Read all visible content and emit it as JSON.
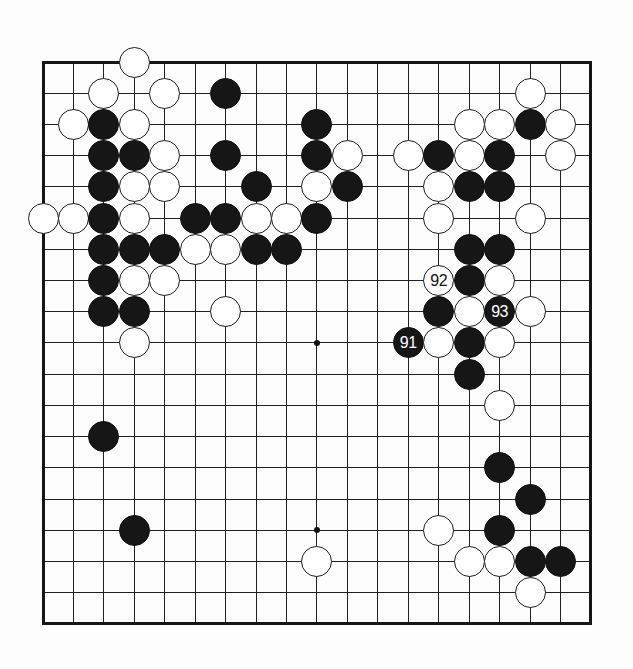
{
  "diagram": {
    "type": "go-board-diagram",
    "board_size": 19,
    "visible_move_numbers": [
      "91",
      "92",
      "93"
    ],
    "colors": {
      "black_stone": "#161616",
      "white_stone": "#ffffff",
      "grid_line": "#202020",
      "page_background": "#fdfdfd"
    },
    "star_points": [
      [
        3,
        3
      ],
      [
        9,
        3
      ],
      [
        15,
        3
      ],
      [
        3,
        9
      ],
      [
        9,
        9
      ],
      [
        15,
        9
      ],
      [
        3,
        15
      ],
      [
        9,
        15
      ],
      [
        15,
        15
      ]
    ],
    "stones": [
      {
        "col": 3,
        "row": 0,
        "color": "white"
      },
      {
        "col": 2,
        "row": 1,
        "color": "white"
      },
      {
        "col": 4,
        "row": 1,
        "color": "white"
      },
      {
        "col": 6,
        "row": 1,
        "color": "black"
      },
      {
        "col": 16,
        "row": 1,
        "color": "white"
      },
      {
        "col": 1,
        "row": 2,
        "color": "white"
      },
      {
        "col": 2,
        "row": 2,
        "color": "black"
      },
      {
        "col": 3,
        "row": 2,
        "color": "white"
      },
      {
        "col": 9,
        "row": 2,
        "color": "black"
      },
      {
        "col": 14,
        "row": 2,
        "color": "white"
      },
      {
        "col": 15,
        "row": 2,
        "color": "white"
      },
      {
        "col": 16,
        "row": 2,
        "color": "black"
      },
      {
        "col": 17,
        "row": 2,
        "color": "white"
      },
      {
        "col": 2,
        "row": 3,
        "color": "black"
      },
      {
        "col": 3,
        "row": 3,
        "color": "black"
      },
      {
        "col": 4,
        "row": 3,
        "color": "white"
      },
      {
        "col": 6,
        "row": 3,
        "color": "black"
      },
      {
        "col": 9,
        "row": 3,
        "color": "black"
      },
      {
        "col": 10,
        "row": 3,
        "color": "white"
      },
      {
        "col": 12,
        "row": 3,
        "color": "white"
      },
      {
        "col": 13,
        "row": 3,
        "color": "black"
      },
      {
        "col": 14,
        "row": 3,
        "color": "white"
      },
      {
        "col": 15,
        "row": 3,
        "color": "black"
      },
      {
        "col": 17,
        "row": 3,
        "color": "white"
      },
      {
        "col": 2,
        "row": 4,
        "color": "black"
      },
      {
        "col": 3,
        "row": 4,
        "color": "white"
      },
      {
        "col": 4,
        "row": 4,
        "color": "white"
      },
      {
        "col": 7,
        "row": 4,
        "color": "black"
      },
      {
        "col": 9,
        "row": 4,
        "color": "white"
      },
      {
        "col": 10,
        "row": 4,
        "color": "black"
      },
      {
        "col": 13,
        "row": 4,
        "color": "white"
      },
      {
        "col": 14,
        "row": 4,
        "color": "black"
      },
      {
        "col": 15,
        "row": 4,
        "color": "black"
      },
      {
        "col": 0,
        "row": 5,
        "color": "white"
      },
      {
        "col": 1,
        "row": 5,
        "color": "white"
      },
      {
        "col": 2,
        "row": 5,
        "color": "black"
      },
      {
        "col": 3,
        "row": 5,
        "color": "white"
      },
      {
        "col": 5,
        "row": 5,
        "color": "black"
      },
      {
        "col": 6,
        "row": 5,
        "color": "black"
      },
      {
        "col": 7,
        "row": 5,
        "color": "white"
      },
      {
        "col": 8,
        "row": 5,
        "color": "white"
      },
      {
        "col": 9,
        "row": 5,
        "color": "black"
      },
      {
        "col": 13,
        "row": 5,
        "color": "white"
      },
      {
        "col": 16,
        "row": 5,
        "color": "white"
      },
      {
        "col": 2,
        "row": 6,
        "color": "black"
      },
      {
        "col": 3,
        "row": 6,
        "color": "black"
      },
      {
        "col": 4,
        "row": 6,
        "color": "black"
      },
      {
        "col": 5,
        "row": 6,
        "color": "white"
      },
      {
        "col": 6,
        "row": 6,
        "color": "white"
      },
      {
        "col": 7,
        "row": 6,
        "color": "black"
      },
      {
        "col": 8,
        "row": 6,
        "color": "black"
      },
      {
        "col": 14,
        "row": 6,
        "color": "black"
      },
      {
        "col": 15,
        "row": 6,
        "color": "black"
      },
      {
        "col": 2,
        "row": 7,
        "color": "black"
      },
      {
        "col": 3,
        "row": 7,
        "color": "white"
      },
      {
        "col": 4,
        "row": 7,
        "color": "white"
      },
      {
        "col": 13,
        "row": 7,
        "color": "white",
        "label": "92"
      },
      {
        "col": 14,
        "row": 7,
        "color": "black"
      },
      {
        "col": 15,
        "row": 7,
        "color": "white"
      },
      {
        "col": 2,
        "row": 8,
        "color": "black"
      },
      {
        "col": 3,
        "row": 8,
        "color": "black"
      },
      {
        "col": 6,
        "row": 8,
        "color": "white"
      },
      {
        "col": 13,
        "row": 8,
        "color": "black"
      },
      {
        "col": 14,
        "row": 8,
        "color": "white"
      },
      {
        "col": 15,
        "row": 8,
        "color": "black",
        "label": "93"
      },
      {
        "col": 16,
        "row": 8,
        "color": "white"
      },
      {
        "col": 3,
        "row": 9,
        "color": "white"
      },
      {
        "col": 12,
        "row": 9,
        "color": "black",
        "label": "91"
      },
      {
        "col": 13,
        "row": 9,
        "color": "white"
      },
      {
        "col": 14,
        "row": 9,
        "color": "black"
      },
      {
        "col": 15,
        "row": 9,
        "color": "white"
      },
      {
        "col": 14,
        "row": 10,
        "color": "black"
      },
      {
        "col": 15,
        "row": 11,
        "color": "white"
      },
      {
        "col": 2,
        "row": 12,
        "color": "black"
      },
      {
        "col": 15,
        "row": 13,
        "color": "black"
      },
      {
        "col": 16,
        "row": 14,
        "color": "black"
      },
      {
        "col": 3,
        "row": 15,
        "color": "black"
      },
      {
        "col": 13,
        "row": 15,
        "color": "white"
      },
      {
        "col": 15,
        "row": 15,
        "color": "black"
      },
      {
        "col": 9,
        "row": 16,
        "color": "white"
      },
      {
        "col": 14,
        "row": 16,
        "color": "white"
      },
      {
        "col": 15,
        "row": 16,
        "color": "white"
      },
      {
        "col": 16,
        "row": 16,
        "color": "black"
      },
      {
        "col": 17,
        "row": 16,
        "color": "black"
      },
      {
        "col": 16,
        "row": 17,
        "color": "white"
      }
    ]
  }
}
